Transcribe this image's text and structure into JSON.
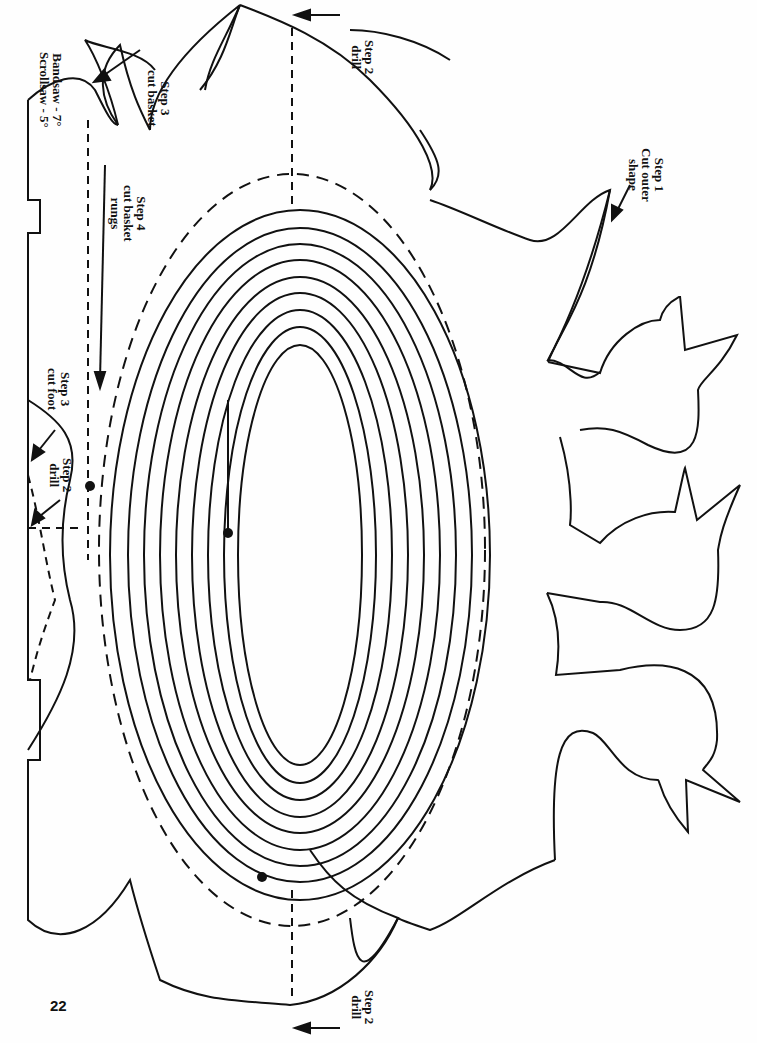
{
  "page_number": "22",
  "labels": {
    "step1": {
      "line1": "Step 1",
      "line2": "Cut outer",
      "line3": "shape"
    },
    "step2_top": {
      "line1": "Step 2",
      "line2": "drill"
    },
    "step2_mid": {
      "line1": "Step 2",
      "line2": "drill"
    },
    "step2_bottom": {
      "line1": "Step 2",
      "line2": "drill"
    },
    "step3_basket": {
      "line1": "Step 3",
      "line2": "cut basket"
    },
    "step3_foot": {
      "line1": "Step 3",
      "line2": "cut foot"
    },
    "step4": {
      "line1": "Step 4",
      "line2": "cut basket",
      "line3": "rungs"
    },
    "angles": {
      "line1": "Bandsaw - 7°",
      "line2": "Scrollsaw - 5°"
    }
  },
  "colors": {
    "line": "#111111",
    "background": "#fefefe"
  }
}
